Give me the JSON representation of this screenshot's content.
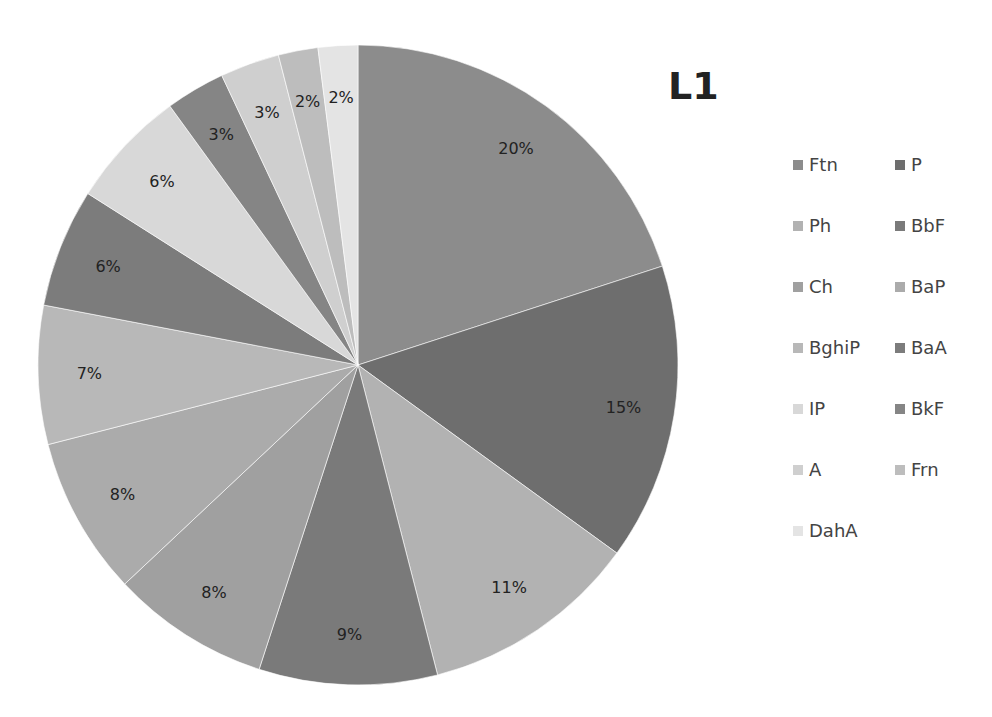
{
  "chart_data": {
    "type": "pie",
    "title": "L1",
    "categories": [
      "Ftn",
      "P",
      "Ph",
      "BbF",
      "Ch",
      "BaP",
      "BghiP",
      "BaA",
      "IP",
      "BkF",
      "A",
      "Frn",
      "DahA"
    ],
    "values": [
      20,
      15,
      11,
      9,
      8,
      8,
      7,
      6,
      6,
      3,
      3,
      2,
      2
    ],
    "labels": [
      "20%",
      "15%",
      "11%",
      "9%",
      "8%",
      "8%",
      "7%",
      "6%",
      "6%",
      "3%",
      "3%",
      "2%",
      "2%"
    ],
    "colors": [
      "#8c8c8c",
      "#6e6e6e",
      "#b2b2b2",
      "#7a7a7a",
      "#a0a0a0",
      "#ababab",
      "#b8b8b8",
      "#7c7c7c",
      "#d8d8d8",
      "#858585",
      "#cfcfcf",
      "#bdbdbd",
      "#e4e4e4"
    ],
    "legend_position": "right",
    "start_angle": "12 o'clock, clockwise"
  },
  "legend": {
    "items": [
      {
        "label": "Ftn",
        "color": "#8c8c8c"
      },
      {
        "label": "P",
        "color": "#6e6e6e"
      },
      {
        "label": "Ph",
        "color": "#b2b2b2"
      },
      {
        "label": "BbF",
        "color": "#7a7a7a"
      },
      {
        "label": "Ch",
        "color": "#a0a0a0"
      },
      {
        "label": "BaP",
        "color": "#ababab"
      },
      {
        "label": "BghiP",
        "color": "#b8b8b8"
      },
      {
        "label": "BaA",
        "color": "#7c7c7c"
      },
      {
        "label": "IP",
        "color": "#d8d8d8"
      },
      {
        "label": "BkF",
        "color": "#858585"
      },
      {
        "label": "A",
        "color": "#cfcfcf"
      },
      {
        "label": "Frn",
        "color": "#bdbdbd"
      },
      {
        "label": "DahA",
        "color": "#e4e4e4"
      }
    ]
  }
}
